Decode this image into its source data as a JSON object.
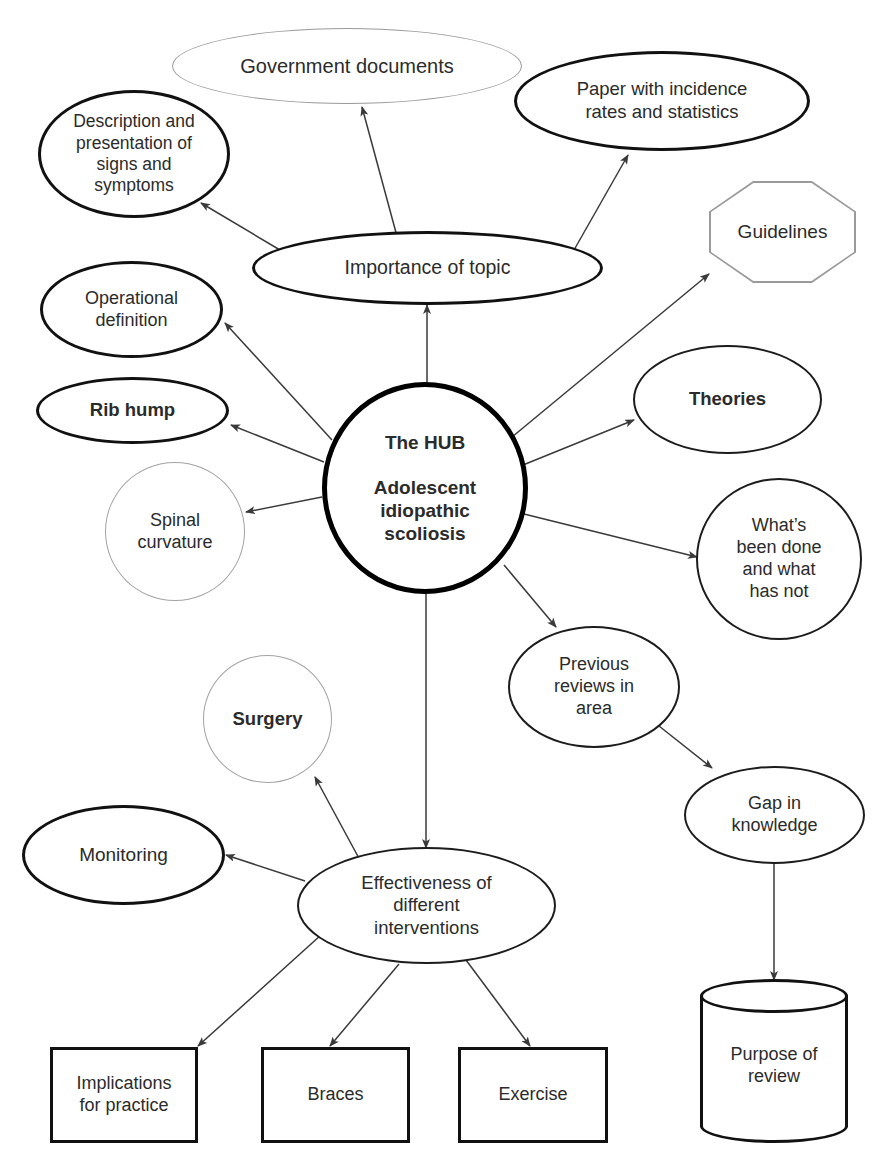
{
  "diagram": {
    "colors": {
      "ink": "#2b2b2b",
      "stroke_dark": "#111111",
      "stroke_gray": "#9a9a9a",
      "background": "#ffffff"
    }
  },
  "nodes": {
    "hub": {
      "line1": "The HUB",
      "line2": "Adolescent\nidiopathic\nscoliosis"
    },
    "government_documents": {
      "label": "Government documents"
    },
    "description_signs_symptoms": {
      "label": "Description and\npresentation of\nsigns and\nsymptoms"
    },
    "paper_incidence": {
      "label": "Paper with incidence\nrates and statistics"
    },
    "importance_of_topic": {
      "label": "Importance of topic"
    },
    "guidelines": {
      "label": "Guidelines"
    },
    "operational_definition": {
      "label": "Operational\ndefinition"
    },
    "rib_hump": {
      "label": "Rib hump"
    },
    "theories": {
      "label": "Theories"
    },
    "spinal_curvature": {
      "label": "Spinal\ncurvature"
    },
    "whats_been_done": {
      "label": "What’s\nbeen done\nand what\nhas not"
    },
    "previous_reviews": {
      "label": "Previous\nreviews in\narea"
    },
    "gap_in_knowledge": {
      "label": "Gap in\nknowledge"
    },
    "purpose_of_review": {
      "label": "Purpose of\nreview"
    },
    "surgery": {
      "label": "Surgery"
    },
    "monitoring": {
      "label": "Monitoring"
    },
    "effectiveness_interventions": {
      "label": "Effectiveness of\ndifferent\ninterventions"
    },
    "implications_for_practice": {
      "label": "Implications\nfor practice"
    },
    "braces": {
      "label": "Braces"
    },
    "exercise": {
      "label": "Exercise"
    }
  },
  "edges": [
    {
      "from": "importance_of_topic",
      "to": "government_documents"
    },
    {
      "from": "importance_of_topic",
      "to": "paper_incidence"
    },
    {
      "from": "importance_of_topic",
      "to": "description_signs_symptoms"
    },
    {
      "from": "hub",
      "to": "importance_of_topic"
    },
    {
      "from": "hub",
      "to": "guidelines"
    },
    {
      "from": "hub",
      "to": "operational_definition"
    },
    {
      "from": "hub",
      "to": "rib_hump"
    },
    {
      "from": "hub",
      "to": "theories"
    },
    {
      "from": "hub",
      "to": "spinal_curvature"
    },
    {
      "from": "hub",
      "to": "whats_been_done"
    },
    {
      "from": "hub",
      "to": "previous_reviews"
    },
    {
      "from": "hub",
      "to": "effectiveness_interventions"
    },
    {
      "from": "previous_reviews",
      "to": "gap_in_knowledge"
    },
    {
      "from": "gap_in_knowledge",
      "to": "purpose_of_review"
    },
    {
      "from": "effectiveness_interventions",
      "to": "surgery"
    },
    {
      "from": "effectiveness_interventions",
      "to": "monitoring"
    },
    {
      "from": "effectiveness_interventions",
      "to": "implications_for_practice"
    },
    {
      "from": "effectiveness_interventions",
      "to": "braces"
    },
    {
      "from": "effectiveness_interventions",
      "to": "exercise"
    }
  ]
}
